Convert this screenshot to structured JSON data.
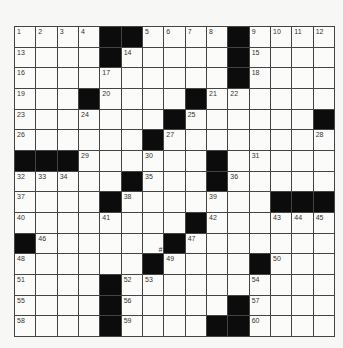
{
  "puzzle": {
    "rows": 15,
    "cols": 15,
    "grid": [
      "....##....#....",
      "....#.....#....",
      "..........#....",
      "...#....#......",
      ".......#......#",
      "......#........",
      "###......#.....",
      ".....#...#.....",
      "....#.......###",
      "........#......",
      "#......#.......",
      "......#....#...",
      "....#..........",
      "....#.....#....",
      "....#....##...."
    ],
    "numbers": [
      {
        "r": 0,
        "c": 0,
        "n": "1"
      },
      {
        "r": 0,
        "c": 1,
        "n": "2"
      },
      {
        "r": 0,
        "c": 2,
        "n": "3"
      },
      {
        "r": 0,
        "c": 3,
        "n": "4"
      },
      {
        "r": 0,
        "c": 6,
        "n": "5"
      },
      {
        "r": 0,
        "c": 7,
        "n": "6"
      },
      {
        "r": 0,
        "c": 8,
        "n": "7"
      },
      {
        "r": 0,
        "c": 9,
        "n": "8"
      },
      {
        "r": 0,
        "c": 11,
        "n": "9"
      },
      {
        "r": 0,
        "c": 12,
        "n": "10"
      },
      {
        "r": 0,
        "c": 13,
        "n": "11"
      },
      {
        "r": 0,
        "c": 14,
        "n": "12"
      },
      {
        "r": 1,
        "c": 0,
        "n": "13"
      },
      {
        "r": 1,
        "c": 5,
        "n": "14"
      },
      {
        "r": 1,
        "c": 11,
        "n": "15"
      },
      {
        "r": 2,
        "c": 0,
        "n": "16"
      },
      {
        "r": 2,
        "c": 4,
        "n": "17"
      },
      {
        "r": 2,
        "c": 11,
        "n": "18"
      },
      {
        "r": 3,
        "c": 0,
        "n": "19"
      },
      {
        "r": 3,
        "c": 4,
        "n": "20"
      },
      {
        "r": 3,
        "c": 9,
        "n": "21"
      },
      {
        "r": 3,
        "c": 10,
        "n": "22"
      },
      {
        "r": 4,
        "c": 0,
        "n": "23"
      },
      {
        "r": 4,
        "c": 3,
        "n": "24"
      },
      {
        "r": 4,
        "c": 8,
        "n": "25"
      },
      {
        "r": 5,
        "c": 0,
        "n": "26"
      },
      {
        "r": 5,
        "c": 7,
        "n": "27"
      },
      {
        "r": 5,
        "c": 14,
        "n": "28"
      },
      {
        "r": 6,
        "c": 3,
        "n": "29"
      },
      {
        "r": 6,
        "c": 6,
        "n": "30"
      },
      {
        "r": 6,
        "c": 11,
        "n": "31"
      },
      {
        "r": 7,
        "c": 0,
        "n": "32"
      },
      {
        "r": 7,
        "c": 1,
        "n": "33"
      },
      {
        "r": 7,
        "c": 2,
        "n": "34"
      },
      {
        "r": 7,
        "c": 6,
        "n": "35"
      },
      {
        "r": 7,
        "c": 10,
        "n": "36"
      },
      {
        "r": 8,
        "c": 0,
        "n": "37"
      },
      {
        "r": 8,
        "c": 5,
        "n": "38"
      },
      {
        "r": 8,
        "c": 9,
        "n": "39"
      },
      {
        "r": 9,
        "c": 0,
        "n": "40"
      },
      {
        "r": 9,
        "c": 4,
        "n": "41"
      },
      {
        "r": 9,
        "c": 9,
        "n": "42"
      },
      {
        "r": 9,
        "c": 12,
        "n": "43"
      },
      {
        "r": 9,
        "c": 13,
        "n": "44"
      },
      {
        "r": 9,
        "c": 14,
        "n": "45"
      },
      {
        "r": 10,
        "c": 1,
        "n": "46"
      },
      {
        "r": 10,
        "c": 8,
        "n": "47"
      },
      {
        "r": 11,
        "c": 0,
        "n": "48"
      },
      {
        "r": 11,
        "c": 7,
        "n": "49"
      },
      {
        "r": 11,
        "c": 12,
        "n": "50"
      },
      {
        "r": 12,
        "c": 0,
        "n": "51"
      },
      {
        "r": 12,
        "c": 5,
        "n": "52"
      },
      {
        "r": 12,
        "c": 6,
        "n": "53"
      },
      {
        "r": 12,
        "c": 11,
        "n": "54"
      },
      {
        "r": 13,
        "c": 0,
        "n": "55"
      },
      {
        "r": 13,
        "c": 5,
        "n": "56"
      },
      {
        "r": 13,
        "c": 11,
        "n": "57"
      },
      {
        "r": 14,
        "c": 0,
        "n": "58"
      },
      {
        "r": 14,
        "c": 5,
        "n": "59"
      },
      {
        "r": 14,
        "c": 11,
        "n": "60"
      }
    ],
    "marks": [
      {
        "r": 10,
        "c": 6,
        "text": "#"
      }
    ]
  }
}
